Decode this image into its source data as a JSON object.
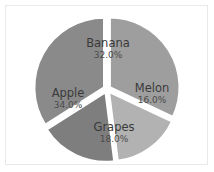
{
  "chart_data": {
    "type": "pie",
    "title": "",
    "categories": [
      "Banana",
      "Melon",
      "Grapes",
      "Apple"
    ],
    "values": [
      32.0,
      16.0,
      18.0,
      34.0
    ],
    "value_labels": [
      "32.0%",
      "16.0%",
      "18.0%",
      "34.0%"
    ],
    "unit": "%",
    "total": 100.0,
    "start_angle_deg": 0,
    "direction": "clockwise",
    "exploded": true,
    "legend": "none",
    "grid": false,
    "slice_colors": [
      "#9e9e9e",
      "#b2b2b2",
      "#7e7e7e",
      "#8a8a8a"
    ],
    "background_color": "#ffffff",
    "label_color": "#3a3a3a",
    "separator_color": "#ffffff"
  },
  "slices": [
    {
      "label": "Banana",
      "percent_label": "32.0%",
      "color": "#9e9e9e",
      "label_x": 108,
      "label_y": 43,
      "pct_x": 108,
      "pct_y": 55
    },
    {
      "label": "Melon",
      "percent_label": "16.0%",
      "color": "#b2b2b2",
      "label_x": 152,
      "label_y": 88,
      "pct_x": 152,
      "pct_y": 100
    },
    {
      "label": "Grapes",
      "percent_label": "18.0%",
      "color": "#7e7e7e",
      "label_x": 114,
      "label_y": 127,
      "pct_x": 114,
      "pct_y": 139
    },
    {
      "label": "Apple",
      "percent_label": "34.0%",
      "color": "#8a8a8a",
      "label_x": 68,
      "label_y": 93,
      "pct_x": 68,
      "pct_y": 105
    }
  ],
  "geometry": {
    "center_x": 107,
    "center_y": 89,
    "radius": 70,
    "explode_offset": 3.2
  }
}
